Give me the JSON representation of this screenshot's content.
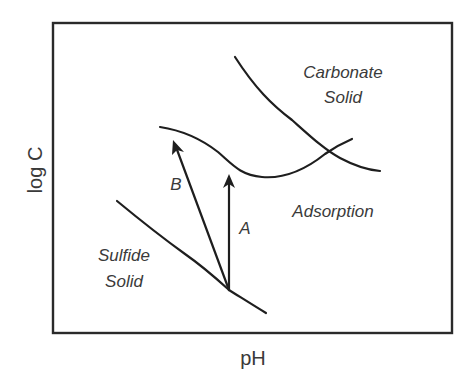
{
  "figure": {
    "axes": {
      "xlabel": "pH",
      "ylabel": "log C"
    },
    "regions": {
      "carbonate": [
        "Carbonate",
        "Solid"
      ],
      "sulfide": [
        "Sulfide",
        "Solid"
      ],
      "adsorption": "Adsorption"
    },
    "arrows": {
      "a": "A",
      "b": "B"
    },
    "curves": [
      {
        "name": "carbonate-solubility-boundary"
      },
      {
        "name": "adsorption-boundary"
      },
      {
        "name": "sulfide-solubility-boundary"
      }
    ],
    "colors": {
      "line": "#1e1e1e",
      "text": "#3a3a3a",
      "background": "#ffffff"
    }
  }
}
